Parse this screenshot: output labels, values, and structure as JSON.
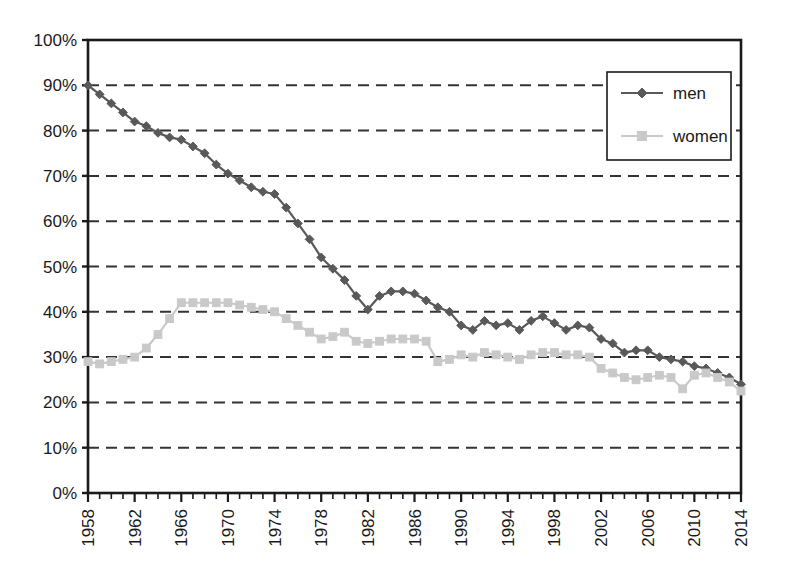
{
  "chart_data": {
    "type": "line",
    "title": "",
    "subtitle": "",
    "xlabel": "",
    "ylabel": "",
    "xlim": [
      1958,
      2014
    ],
    "ylim": [
      0,
      100
    ],
    "grid": true,
    "grid_axis": "y",
    "legend_position": "top-right",
    "y_tick_labels": [
      "100%",
      "90%",
      "80%",
      "70%",
      "60%",
      "50%",
      "40%",
      "30%",
      "20%",
      "10%",
      "0%"
    ],
    "y_tick_values": [
      100,
      90,
      80,
      70,
      60,
      50,
      40,
      30,
      20,
      10,
      0
    ],
    "x_tick_labels": [
      "1958",
      "1962",
      "1966",
      "1970",
      "1974",
      "1978",
      "1982",
      "1986",
      "1990",
      "1994",
      "1998",
      "2002",
      "2006",
      "2010",
      "2014"
    ],
    "x_tick_values": [
      1958,
      1962,
      1966,
      1970,
      1974,
      1978,
      1982,
      1986,
      1990,
      1994,
      1998,
      2002,
      2006,
      2010,
      2014
    ],
    "x": [
      1958,
      1959,
      1960,
      1961,
      1962,
      1963,
      1964,
      1965,
      1966,
      1967,
      1968,
      1969,
      1970,
      1971,
      1972,
      1973,
      1974,
      1975,
      1976,
      1977,
      1978,
      1979,
      1980,
      1981,
      1982,
      1983,
      1984,
      1985,
      1986,
      1987,
      1988,
      1989,
      1990,
      1991,
      1992,
      1993,
      1994,
      1995,
      1996,
      1997,
      1998,
      1999,
      2000,
      2001,
      2002,
      2003,
      2004,
      2005,
      2006,
      2007,
      2008,
      2009,
      2010,
      2011,
      2012,
      2013,
      2014
    ],
    "series": [
      {
        "name": "men",
        "color": "#595959",
        "marker": "diamond",
        "values": [
          90.0,
          88.0,
          86.0,
          84.0,
          82.0,
          81.0,
          79.5,
          78.5,
          78.0,
          76.5,
          75.0,
          72.5,
          70.5,
          69.0,
          67.5,
          66.5,
          66.0,
          63.0,
          59.5,
          56.0,
          52.0,
          49.5,
          47.0,
          43.5,
          40.5,
          43.5,
          44.5,
          44.5,
          44.0,
          42.5,
          41.0,
          40.0,
          37.0,
          36.0,
          38.0,
          37.0,
          37.5,
          36.0,
          38.0,
          39.0,
          37.5,
          36.0,
          37.0,
          36.5,
          34.0,
          33.0,
          31.0,
          31.5,
          31.5,
          30.0,
          29.5,
          29.0,
          28.0,
          27.5,
          26.5,
          25.5,
          24.0
        ]
      },
      {
        "name": "women",
        "color": "#c9c9c9",
        "marker": "square",
        "values": [
          29.0,
          28.5,
          29.0,
          29.5,
          30.0,
          32.0,
          35.0,
          38.5,
          42.0,
          42.0,
          42.0,
          42.0,
          42.0,
          41.5,
          41.0,
          40.5,
          40.0,
          38.5,
          37.0,
          35.5,
          34.0,
          34.5,
          35.5,
          33.5,
          33.0,
          33.5,
          34.0,
          34.0,
          34.0,
          33.5,
          29.0,
          29.5,
          30.5,
          30.0,
          31.0,
          30.5,
          30.0,
          29.5,
          30.5,
          31.0,
          31.0,
          30.5,
          30.5,
          30.0,
          27.5,
          26.5,
          25.5,
          25.0,
          25.5,
          26.0,
          25.5,
          23.0,
          26.0,
          26.5,
          25.5,
          24.5,
          22.5
        ]
      }
    ]
  },
  "legend": {
    "entries": [
      {
        "label": "men"
      },
      {
        "label": "women"
      }
    ]
  }
}
